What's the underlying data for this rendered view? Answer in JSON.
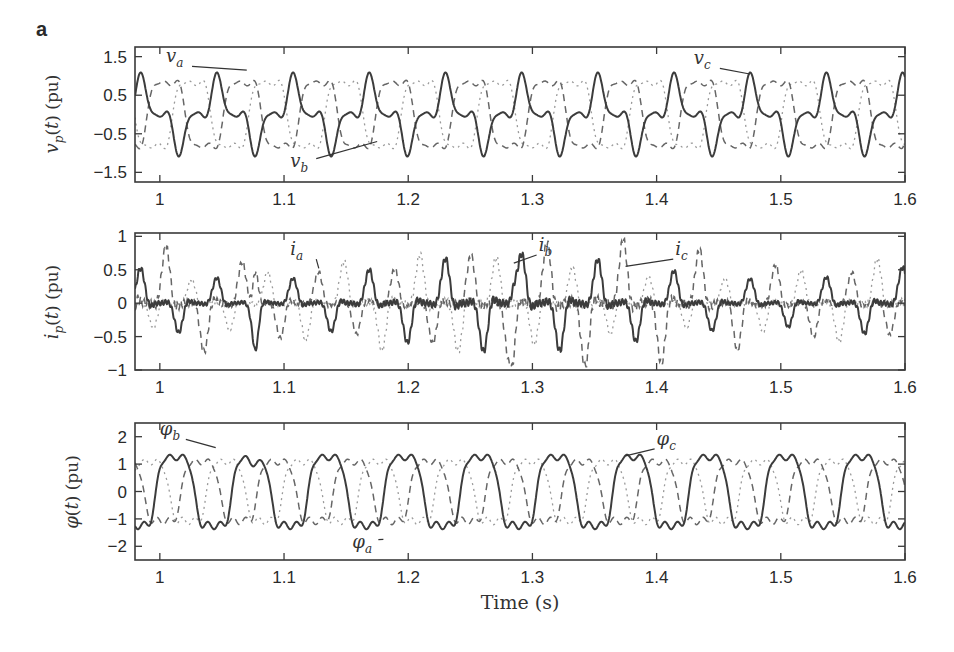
{
  "figure": {
    "panel_letter": "a",
    "xlabel": "Time (s)"
  },
  "chart_data": [
    {
      "type": "line",
      "id": "voltage",
      "title": "",
      "xlabel": "",
      "ylabel": "v_p(t) (pu)",
      "xlim": [
        0.98,
        1.6
      ],
      "ylim": [
        -1.75,
        1.75
      ],
      "xticks": [
        1,
        1.1,
        1.2,
        1.3,
        1.4,
        1.5,
        1.6
      ],
      "xtick_labels": [
        "1",
        "1.1",
        "1.2",
        "1.3",
        "1.4",
        "1.5",
        "1.6"
      ],
      "yticks": [
        1.5,
        0.5,
        -0.5,
        -1.5
      ],
      "ytick_labels": [
        "1.5",
        "0.5",
        "−1.5",
        "−0.5"
      ],
      "ytick_labels_ordered": [
        "1.5",
        "0.5",
        "−0.5",
        "−1.5"
      ],
      "grid": false,
      "series": [
        {
          "name": "v_a",
          "style": "dashed",
          "freq_hz": 16.3,
          "amp": 1.0,
          "phase_deg": -120,
          "harmonic3": 0.25,
          "harmonic5": 0.1
        },
        {
          "name": "v_b",
          "style": "solid",
          "freq_hz": 16.3,
          "amp": 0.7,
          "phase_deg": 0,
          "harmonic3": 0.35,
          "harmonic5": 0.15,
          "note": "peaks ~1.0 at t=0.985, ~0.9 at 1.085, 1.21, 1.33, 1.45, 1.57; troughs ~-0.9"
        },
        {
          "name": "v_c",
          "style": "dotted",
          "freq_hz": 16.3,
          "amp": 1.0,
          "phase_deg": 120,
          "harmonic3": 0.25,
          "harmonic5": 0.1
        }
      ],
      "annotations": [
        {
          "text": "v",
          "sub": "a",
          "x": 1.005,
          "y": 1.35,
          "arrow_to": [
            1.07,
            1.15
          ]
        },
        {
          "text": "v",
          "sub": "b",
          "x": 1.105,
          "y": -1.35,
          "arrow_to": [
            1.175,
            -0.7
          ]
        },
        {
          "text": "v",
          "sub": "c",
          "x": 1.43,
          "y": 1.3,
          "arrow_to": [
            1.475,
            1.05
          ]
        }
      ]
    },
    {
      "type": "line",
      "id": "current",
      "title": "",
      "xlabel": "",
      "ylabel": "i_p(t) (pu)",
      "xlim": [
        0.98,
        1.6
      ],
      "ylim": [
        -1.0,
        1.05
      ],
      "xticks": [
        1,
        1.1,
        1.2,
        1.3,
        1.4,
        1.5,
        1.6
      ],
      "xtick_labels": [
        "1",
        "1.1",
        "1.2",
        "1.3",
        "1.4",
        "1.5",
        "1.6"
      ],
      "yticks": [
        1,
        0.5,
        0,
        -0.5,
        -1
      ],
      "ytick_labels_ordered": [
        "1",
        "0.5",
        "0",
        "−0.5",
        "−1"
      ],
      "grid": false,
      "series": [
        {
          "name": "i_a",
          "style": "dashed",
          "range": [
            -0.85,
            0.9
          ],
          "note": "spiky, peak ~0.9 near t=1.077, min ~-0.85 near t=1.285"
        },
        {
          "name": "i_b",
          "style": "solid",
          "range": [
            -0.7,
            0.6
          ],
          "note": "spikes ~0.45 typical, 0.6 at t=1.285, -0.7 at t=1.077"
        },
        {
          "name": "i_c",
          "style": "dotted",
          "range": [
            -0.5,
            0.5
          ]
        }
      ],
      "annotations": [
        {
          "text": "i",
          "sub": "a",
          "x": 1.105,
          "y": 0.72,
          "arrow_to": [
            1.128,
            0.52
          ]
        },
        {
          "text": "i",
          "sub": "b",
          "x": 1.305,
          "y": 0.78,
          "arrow_to": [
            1.285,
            0.6
          ]
        },
        {
          "text": "i",
          "sub": "c",
          "x": 1.415,
          "y": 0.72,
          "arrow_to": [
            1.375,
            0.55
          ]
        }
      ]
    },
    {
      "type": "line",
      "id": "flux",
      "title": "",
      "xlabel": "Time (s)",
      "ylabel": "φ(t) (pu)",
      "xlim": [
        0.98,
        1.6
      ],
      "ylim": [
        -2.5,
        2.5
      ],
      "xticks": [
        1,
        1.1,
        1.2,
        1.3,
        1.4,
        1.5,
        1.6
      ],
      "xtick_labels": [
        "1",
        "1.1",
        "1.2",
        "1.3",
        "1.4",
        "1.5",
        "1.6"
      ],
      "yticks": [
        2,
        1,
        0,
        -1,
        -2
      ],
      "ytick_labels_ordered": [
        "2",
        "1",
        "0",
        "−1",
        "−2"
      ],
      "grid": false,
      "series": [
        {
          "name": "φ_a",
          "style": "dashed",
          "freq_hz": 16.3,
          "amp": 1.3,
          "phase_deg": -120
        },
        {
          "name": "φ_b",
          "style": "solid",
          "freq_hz": 16.3,
          "amp": 1.5,
          "phase_deg": 0,
          "note": "flat-topped, peaks ~1.5, troughs ~-1.5; min -1.75 near t=1.077"
        },
        {
          "name": "φ_c",
          "style": "dotted",
          "freq_hz": 16.3,
          "amp": 1.3,
          "phase_deg": 120
        }
      ],
      "annotations": [
        {
          "text": "φ",
          "sub": "b",
          "x": 1.0,
          "y": 2.05,
          "arrow_to": [
            1.045,
            1.6
          ]
        },
        {
          "text": "φ",
          "sub": "a",
          "x": 1.155,
          "y": -2.05,
          "arrow_to": [
            1.18,
            -1.75
          ]
        },
        {
          "text": "φ",
          "sub": "c",
          "x": 1.4,
          "y": 1.7,
          "arrow_to": [
            1.375,
            1.3
          ]
        }
      ]
    }
  ]
}
